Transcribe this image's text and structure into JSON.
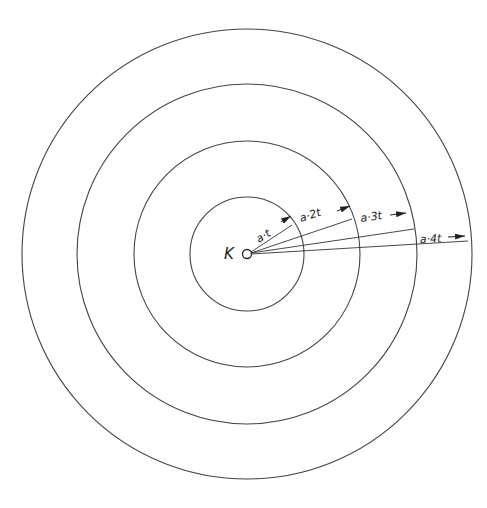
{
  "diagram": {
    "center_label": "K",
    "center": {
      "x": 247,
      "y": 254
    },
    "rings": [
      {
        "radius": 57,
        "label": "a·t"
      },
      {
        "radius": 113,
        "label": "a·2t"
      },
      {
        "radius": 170,
        "label": "a·3t"
      },
      {
        "radius": 225,
        "label": "a·4t"
      }
    ],
    "stroke_color": "#444444"
  }
}
